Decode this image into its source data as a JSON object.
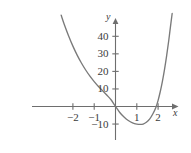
{
  "chart_data": {
    "type": "line",
    "title": "",
    "subtitle": "",
    "xlabel": "x",
    "ylabel": "y",
    "xlim": [
      -3.1,
      3.0
    ],
    "ylim": [
      -20,
      52
    ],
    "grid": false,
    "legend": null,
    "x_ticks": [
      {
        "value": -2,
        "label": "−2"
      },
      {
        "value": -1,
        "label": "−1"
      },
      {
        "value": 1,
        "label": "1"
      },
      {
        "value": 2,
        "label": "2"
      }
    ],
    "y_ticks": [
      {
        "value": 40,
        "label": "40"
      },
      {
        "value": 30,
        "label": "30"
      },
      {
        "value": 20,
        "label": "20"
      },
      {
        "value": 10,
        "label": "10"
      },
      {
        "value": -10,
        "label": "−10"
      }
    ],
    "series": [
      {
        "name": "curve",
        "color": "#7a7a7a",
        "points": [
          {
            "x": -2.55,
            "y": 52.0
          },
          {
            "x": -2.4,
            "y": 46.6
          },
          {
            "x": -2.2,
            "y": 40.2
          },
          {
            "x": -2.0,
            "y": 34.4
          },
          {
            "x": -1.8,
            "y": 29.3
          },
          {
            "x": -1.6,
            "y": 24.8
          },
          {
            "x": -1.4,
            "y": 20.8
          },
          {
            "x": -1.2,
            "y": 17.3
          },
          {
            "x": -1.0,
            "y": 14.2
          },
          {
            "x": -0.8,
            "y": 11.4
          },
          {
            "x": -0.6,
            "y": 8.9
          },
          {
            "x": -0.4,
            "y": 6.4
          },
          {
            "x": -0.2,
            "y": 3.7
          },
          {
            "x": 0.0,
            "y": 0.0
          },
          {
            "x": 0.2,
            "y": -3.4
          },
          {
            "x": 0.4,
            "y": -6.0
          },
          {
            "x": 0.6,
            "y": -8.0
          },
          {
            "x": 0.8,
            "y": -9.3
          },
          {
            "x": 1.0,
            "y": -10.0
          },
          {
            "x": 1.15,
            "y": -10.2
          },
          {
            "x": 1.3,
            "y": -10.0
          },
          {
            "x": 1.45,
            "y": -9.0
          },
          {
            "x": 1.6,
            "y": -7.2
          },
          {
            "x": 1.75,
            "y": -4.3
          },
          {
            "x": 1.9,
            "y": -0.4
          },
          {
            "x": 2.0,
            "y": 3.5
          },
          {
            "x": 2.1,
            "y": 8.4
          },
          {
            "x": 2.2,
            "y": 14.2
          },
          {
            "x": 2.3,
            "y": 21.0
          },
          {
            "x": 2.4,
            "y": 28.8
          },
          {
            "x": 2.5,
            "y": 37.6
          },
          {
            "x": 2.6,
            "y": 47.4
          },
          {
            "x": 2.66,
            "y": 53.0
          }
        ]
      }
    ],
    "axis_color": "#6e6e6e",
    "curve_color": "#7a7a7a",
    "background": "#ffffff"
  },
  "axes": {
    "x_label": "x",
    "y_label": "y"
  }
}
